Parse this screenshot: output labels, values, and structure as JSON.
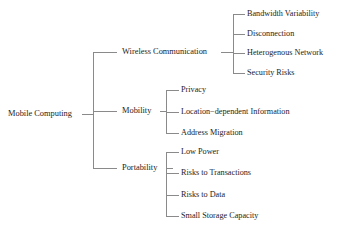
{
  "diagram": {
    "type": "tree",
    "title": "Mobile Computing",
    "orientation": "left-to-right",
    "background_color": "#ffffff",
    "line_color": "#8a8a8a",
    "text_color": "#1d1d1d",
    "root": {
      "label": "Mobile Computing",
      "x": 8,
      "y": 114
    },
    "branches": [
      {
        "label": "Wireless Communication",
        "x": 122,
        "y": 52,
        "trunk_x": 233,
        "children": [
          {
            "label": "Bandwidth Variability",
            "x": 247,
            "y": 14
          },
          {
            "label": "Disconnection",
            "x": 247,
            "y": 34
          },
          {
            "label": "Heterogenous Network",
            "x": 247,
            "y": 53
          },
          {
            "label": "Security Risks",
            "x": 247,
            "y": 73
          }
        ]
      },
      {
        "label": "Mobility",
        "x": 122,
        "y": 111,
        "trunk_x": 166,
        "children": [
          {
            "label": "Privacy",
            "x": 181,
            "y": 90
          },
          {
            "label": "Location−dependent Information",
            "x": 181,
            "y": 112
          },
          {
            "label": "Address Migration",
            "x": 181,
            "y": 133
          }
        ]
      },
      {
        "label": "Portability",
        "x": 122,
        "y": 168,
        "trunk_x": 166,
        "children": [
          {
            "label": "Low Power",
            "x": 181,
            "y": 152
          },
          {
            "label": "Risks to Transactions",
            "x": 181,
            "y": 173
          },
          {
            "label": "Risks to Data",
            "x": 181,
            "y": 195
          },
          {
            "label": "Small Storage Capacity",
            "x": 181,
            "y": 216
          }
        ]
      }
    ],
    "geometry": {
      "root_stub_x1": 82,
      "root_stub_x2": 93,
      "level1_trunk_x": 93,
      "level1_trunk_y_top": 52,
      "level1_trunk_y_bottom": 168,
      "level1_stub_x2": 117,
      "level2_stub_x2": 245,
      "level2_stub_x2_small": 179
    }
  }
}
